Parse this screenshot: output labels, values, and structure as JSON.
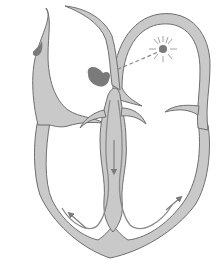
{
  "diagram": {
    "labels": [],
    "colors": {
      "background": "#ffffff",
      "wall_fill": "#c9c9c9",
      "wall_stroke": "#6e6e6e",
      "node_fill": "#7a7a7a",
      "conduction_line": "#8a8a8a",
      "rays": "#9a9a9a"
    },
    "elements": [
      {
        "name": "left-atrium-wall",
        "kind": "wall"
      },
      {
        "name": "right-atrium-wall",
        "kind": "wall"
      },
      {
        "name": "ventricle-wall",
        "kind": "wall"
      },
      {
        "name": "interventricular-septum",
        "kind": "wall"
      },
      {
        "name": "sa-node",
        "kind": "node"
      },
      {
        "name": "av-node",
        "kind": "node"
      },
      {
        "name": "droplet",
        "kind": "node"
      },
      {
        "name": "internodal-pathway",
        "kind": "dashed-line"
      },
      {
        "name": "bundle-of-his-arrow",
        "kind": "arrow",
        "direction": "down"
      },
      {
        "name": "left-purkinje-arrow",
        "kind": "arrow",
        "direction": "up-left"
      },
      {
        "name": "right-purkinje-arrow",
        "kind": "arrow",
        "direction": "up-right"
      }
    ]
  }
}
